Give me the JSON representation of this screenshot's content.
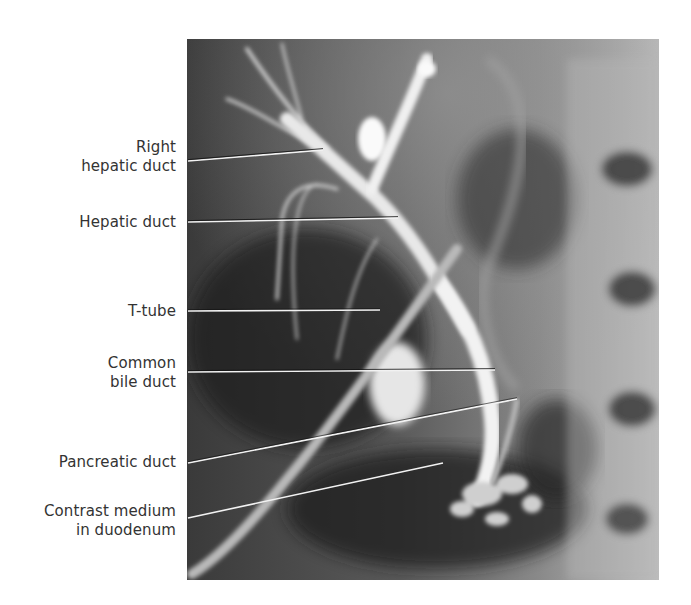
{
  "figure": {
    "image_description": "Radiograph (T-tube cholangiogram) of the biliary tree with contrast medium",
    "labels": [
      {
        "id": "right-hepatic-duct",
        "lines": [
          "Right",
          "hepatic duct"
        ]
      },
      {
        "id": "hepatic-duct",
        "lines": [
          "Hepatic duct"
        ]
      },
      {
        "id": "t-tube",
        "lines": [
          "T-tube"
        ]
      },
      {
        "id": "common-bile-duct",
        "lines": [
          "Common",
          "bile duct"
        ]
      },
      {
        "id": "pancreatic-duct",
        "lines": [
          "Pancreatic duct"
        ]
      },
      {
        "id": "contrast-medium-in-duodenum",
        "lines": [
          "Contrast medium",
          "in duodenum"
        ]
      }
    ],
    "colors": {
      "label_text": "#333333",
      "leader_light": "#f2f2f2",
      "leader_dark": "#111111",
      "background": "#ffffff"
    }
  }
}
